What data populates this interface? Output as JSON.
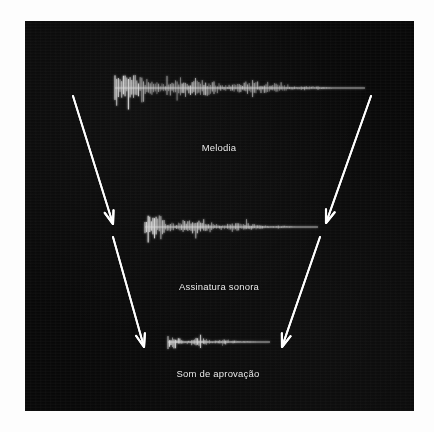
{
  "figure": {
    "background_color": "#fdfdfd",
    "panel_color": "#080808",
    "accent_color": "#ffffff",
    "waveform_color": "#d8d8d8",
    "caption_color": "#e9e9e9"
  },
  "captions": [
    {
      "id": "melodia",
      "label": "Melodia",
      "x": 194,
      "y": 128
    },
    {
      "id": "assinatura-sonora",
      "label": "Assinatura sonora",
      "x": 194,
      "y": 267
    },
    {
      "id": "som-de-aprovacao",
      "label": "Som de aprovação",
      "x": 193,
      "y": 354
    }
  ],
  "waveforms": [
    {
      "id": "melody-waveform",
      "stage": "Melodia",
      "x_start": 90,
      "x_end": 340,
      "baseline_y": 67,
      "amplitude": 13,
      "density": 150
    },
    {
      "id": "sound-signature-waveform",
      "stage": "Assinatura sonora",
      "x_start": 120,
      "x_end": 293,
      "baseline_y": 206,
      "amplitude": 9,
      "density": 110
    },
    {
      "id": "approval-sound-waveform",
      "stage": "Som de aprovação",
      "x_start": 143,
      "x_end": 245,
      "baseline_y": 321,
      "amplitude": 5,
      "density": 70
    }
  ],
  "arrows": [
    {
      "id": "arrow-left-melody-to-signature",
      "from_stage": "Melodia",
      "to_stage": "Assinatura sonora",
      "x1": 48,
      "y1": 75,
      "x2": 88,
      "y2": 203
    },
    {
      "id": "arrow-right-melody-to-signature",
      "from_stage": "Melodia",
      "to_stage": "Assinatura sonora",
      "x1": 346,
      "y1": 75,
      "x2": 301,
      "y2": 202
    },
    {
      "id": "arrow-left-signature-to-approval",
      "from_stage": "Assinatura sonora",
      "to_stage": "Som de aprovação",
      "x1": 88,
      "y1": 216,
      "x2": 119,
      "y2": 326
    },
    {
      "id": "arrow-right-signature-to-approval",
      "from_stage": "Assinatura sonora",
      "to_stage": "Som de aprovação",
      "x1": 295,
      "y1": 216,
      "x2": 257,
      "y2": 326
    }
  ]
}
